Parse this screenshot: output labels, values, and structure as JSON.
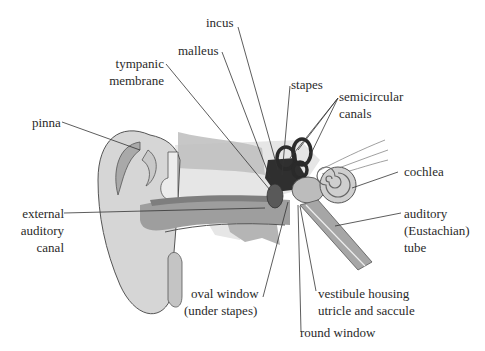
{
  "colors": {
    "skin": "#d4d4d4",
    "skin_outline": "#555555",
    "canal_dark": "#a8a8a8",
    "canal_shadow": "#8c8c8c",
    "bone": "#e9e9e9",
    "bone_texture": "#bdbdbd",
    "ossicles": "#333333",
    "cochlea": "#c9c9c9",
    "leader_line": "#333333",
    "label_text": "#2a2a2a"
  },
  "labels": {
    "incus": "incus",
    "malleus": "malleus",
    "tympanic_1": "tympanic",
    "tympanic_2": "membrane",
    "stapes": "stapes",
    "semicircular_1": "semicircular",
    "semicircular_2": "canals",
    "pinna": "pinna",
    "cochlea": "cochlea",
    "external_1": "external",
    "external_2": "auditory",
    "external_3": "canal",
    "auditory_tube_1": "auditory",
    "auditory_tube_2": "(Eustachian)",
    "auditory_tube_3": "tube",
    "oval_window_1": "oval window",
    "oval_window_2": "(under stapes)",
    "vestibule_1": "vestibule housing",
    "vestibule_2": "utricle and saccule",
    "round_window": "round window"
  }
}
